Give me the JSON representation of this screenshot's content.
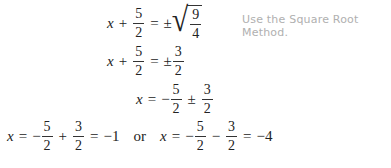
{
  "note": "Use the Square Root Method.",
  "steps": [
    {
      "id": "step1",
      "lhs": {
        "var": "x",
        "op": "+",
        "frac": {
          "num": "5",
          "den": "2"
        }
      },
      "eq": "=",
      "rhs": {
        "sign": "±",
        "sqrt": {
          "num": "9",
          "den": "4"
        }
      }
    },
    {
      "id": "step2",
      "lhs": {
        "var": "x",
        "op": "+",
        "frac": {
          "num": "5",
          "den": "2"
        }
      },
      "eq": "=",
      "rhs": {
        "sign": "±",
        "frac": {
          "num": "3",
          "den": "2"
        }
      }
    },
    {
      "id": "step3",
      "lhs": {
        "var": "x"
      },
      "eq": "=",
      "rhs": {
        "sign1": "−",
        "frac1": {
          "num": "5",
          "den": "2"
        },
        "sign2": "±",
        "frac2": {
          "num": "3",
          "den": "2"
        }
      }
    },
    {
      "id": "step4",
      "left": {
        "var": "x",
        "eq": "=",
        "sign1": "−",
        "frac1": {
          "num": "5",
          "den": "2"
        },
        "op": "+",
        "frac2": {
          "num": "3",
          "den": "2"
        },
        "eq2": "=",
        "result": "−1"
      },
      "connector": "or",
      "right": {
        "var": "x",
        "eq": "=",
        "sign1": "−",
        "frac1": {
          "num": "5",
          "den": "2"
        },
        "op": "−",
        "frac2": {
          "num": "3",
          "den": "2"
        },
        "eq2": "=",
        "result": "−4"
      }
    }
  ]
}
